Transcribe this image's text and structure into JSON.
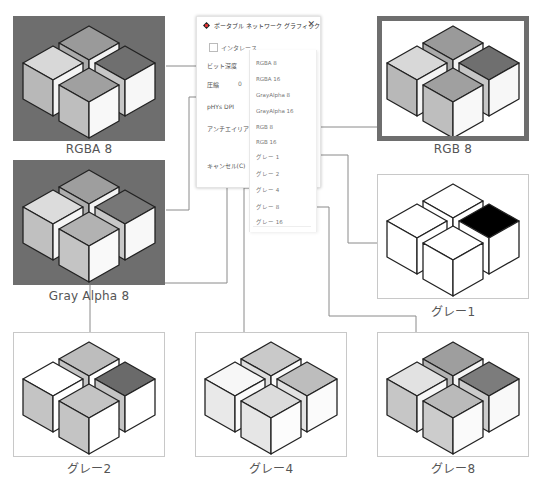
{
  "dialog": {
    "title": "ポータブル ネットワーク グラフィック",
    "close_glyph": "✕",
    "interlace_label": "インタレース",
    "bit_depth_label": "ビット深度",
    "compression_label": "圧縮",
    "compression_value": "0",
    "phys_dpi_label": "pHYs DPI",
    "antialias_label": "アンチエイリアス",
    "cancel_label": "キャンセル(C)"
  },
  "bit_depth_options": [
    "RGBA 8",
    "RGBA 16",
    "GrayAlpha 8",
    "GrayAlpha 16",
    "RGB 8",
    "RGB 16",
    "グレー 1",
    "グレー 2",
    "グレー 4",
    "グレー 8",
    "グレー 16"
  ],
  "samples": {
    "rgba8": {
      "caption": "RGBA 8",
      "bg": "#6e6e6e",
      "faces": [
        "#d8d8d8",
        "#b8b8b8",
        "#f4f4f4",
        "#9a9a9a",
        "#aaaaaa",
        "#f2f2f2",
        "#6f6f6f",
        "#c6c6c6",
        "#f7f7f7",
        "#a0a0a0",
        "#bebebe",
        "#f8f8f8"
      ]
    },
    "rgb8": {
      "caption": "RGB 8",
      "bg": "#ffffff",
      "frame": "#6e6e6e",
      "faces": [
        "#d8d8d8",
        "#b8b8b8",
        "#f4f4f4",
        "#9a9a9a",
        "#aaaaaa",
        "#f2f2f2",
        "#6f6f6f",
        "#c6c6c6",
        "#f7f7f7",
        "#a0a0a0",
        "#bebebe",
        "#f8f8f8"
      ]
    },
    "grayalpha8": {
      "caption": "Gray Alpha 8",
      "bg": "#6e6e6e",
      "faces": [
        "#dcdcdc",
        "#c0c0c0",
        "#f5f5f5",
        "#9e9e9e",
        "#adadad",
        "#f3f3f3",
        "#777777",
        "#c8c8c8",
        "#f8f8f8",
        "#b2b2b2",
        "#c4c4c4",
        "#f9f9f9"
      ]
    },
    "gray1": {
      "caption": "グレー1",
      "bg": "#ffffff",
      "faces": [
        "#ffffff",
        "#ffffff",
        "#ffffff",
        "#ffffff",
        "#ffffff",
        "#ffffff",
        "#000000",
        "#ffffff",
        "#ffffff",
        "#ffffff",
        "#ffffff",
        "#ffffff"
      ]
    },
    "gray2": {
      "caption": "グレー2",
      "bg": "#ffffff",
      "faces": [
        "#ffffff",
        "#c4c4c4",
        "#ffffff",
        "#bdbdbd",
        "#c4c4c4",
        "#ffffff",
        "#6a6a6a",
        "#c4c4c4",
        "#ffffff",
        "#c4c4c4",
        "#c4c4c4",
        "#ffffff"
      ]
    },
    "gray4": {
      "caption": "グレー4",
      "bg": "#ffffff",
      "faces": [
        "#f7f7f7",
        "#e9e9e9",
        "#fbfbfb",
        "#c9c9c9",
        "#dedede",
        "#fafafa",
        "#bdbdbd",
        "#e3e3e3",
        "#fbfbfb",
        "#dcdcdc",
        "#e6e6e6",
        "#fcfcfc"
      ]
    },
    "gray8": {
      "caption": "グレー8",
      "bg": "#ffffff",
      "faces": [
        "#e2e2e2",
        "#c6c6c6",
        "#f7f7f7",
        "#9e9e9e",
        "#b3b3b3",
        "#f4f4f4",
        "#7c7c7c",
        "#cccccc",
        "#f9f9f9",
        "#bababa",
        "#cccccc",
        "#fafafa"
      ]
    }
  },
  "colors": {
    "connector": "#8a8a8a",
    "panel_border": "#c8c8c8",
    "cube_edge": "#222222"
  }
}
